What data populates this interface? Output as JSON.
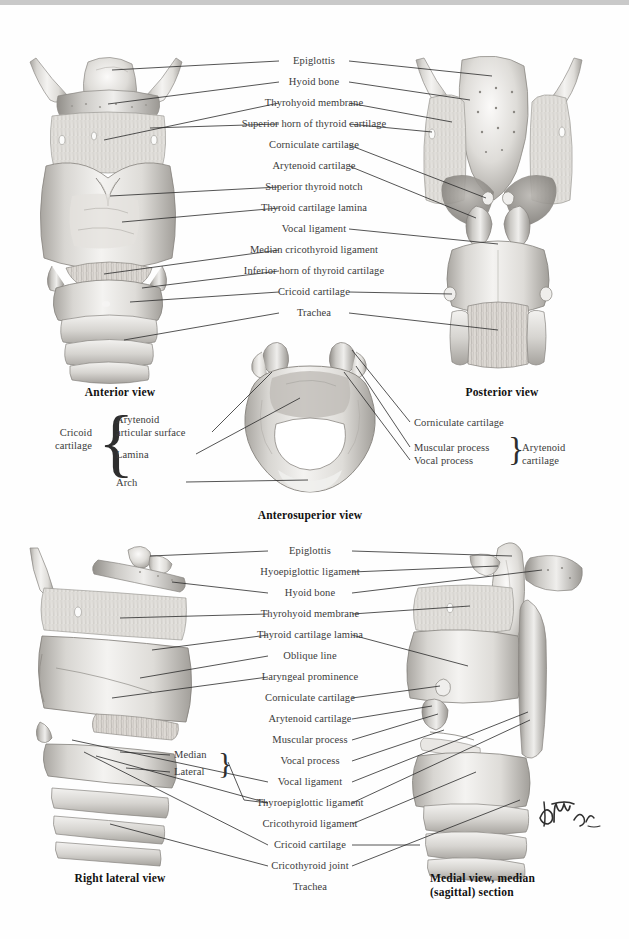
{
  "plate": {
    "title": "Larynx: Cartilages and Ligaments",
    "signature": "F. Netter"
  },
  "views": [
    {
      "id": "anterior",
      "caption": "Anterior view"
    },
    {
      "id": "posterior",
      "caption": "Posterior view"
    },
    {
      "id": "anterosuperior",
      "caption": "Anterosuperior view"
    },
    {
      "id": "right-lateral",
      "caption": "Right lateral view"
    },
    {
      "id": "medial-sagittal",
      "caption": "Medial view, median\n(sagittal) section"
    }
  ],
  "captions": {
    "anterior": "Anterior view",
    "posterior": "Posterior view",
    "anterosuperior": "Anterosuperior view",
    "right_lateral": "Right lateral view",
    "medial_line1": "Medial view, median",
    "medial_line2": "(sagittal) section"
  },
  "top_panel": {
    "labels": [
      "Epiglottis",
      "Hyoid bone",
      "Thyrohyoid membrane",
      "Superior horn of thyroid cartilage",
      "Corniculate cartilage",
      "Arytenoid cartilage",
      "Superior thyroid notch",
      "Thyroid cartilage lamina",
      "Vocal ligament",
      "Median cricothyroid ligament",
      "Inferior horn of thyroid cartilage",
      "Cricoid cartilage",
      "Trachea"
    ]
  },
  "middle_panel": {
    "left_group_title_line1": "Cricoid",
    "left_group_title_line2": "cartilage",
    "left_items": [
      "Arytenoid",
      "articular surface",
      "Lamina",
      "Arch"
    ],
    "left_item_full": [
      "Arytenoid articular surface",
      "Lamina",
      "Arch"
    ],
    "right_labels": [
      "Corniculate cartilage",
      "Muscular process",
      "Vocal process"
    ],
    "right_group_title_line1": "Arytenoid",
    "right_group_title_line2": "cartilage"
  },
  "bottom_panel": {
    "labels": [
      "Epiglottis",
      "Hyoepiglottic ligament",
      "Hyoid bone",
      "Thyrohyoid membrane",
      "Thyroid cartilage lamina",
      "Oblique line",
      "Laryngeal prominence",
      "Corniculate cartilage",
      "Arytenoid cartilage",
      "Muscular process",
      "Vocal process",
      "Vocal ligament",
      "Thyroepiglottic ligament",
      "Cricothyroid ligament",
      "Cricoid cartilage",
      "Cricothyroid joint",
      "Trachea"
    ],
    "sub_labels": [
      "Median",
      "Lateral"
    ]
  },
  "colors": {
    "background": "#ffffff",
    "label_text": "#3b3b3b",
    "caption_text": "#111111",
    "leader_line": "#2a2a2a",
    "topbar": "#c9c9c9",
    "cartilage_light": "#f2f1ef",
    "cartilage_mid": "#d2d0cc",
    "cartilage_dark": "#a8a5a0",
    "shadow": "#7d7a75"
  }
}
